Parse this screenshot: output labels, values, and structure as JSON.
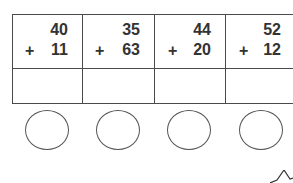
{
  "worksheet": {
    "problems": [
      {
        "top": "40",
        "operator": "+",
        "bottom": "11",
        "answer": ""
      },
      {
        "top": "35",
        "operator": "+",
        "bottom": "63",
        "answer": ""
      },
      {
        "top": "44",
        "operator": "+",
        "bottom": "20",
        "answer": ""
      },
      {
        "top": "52",
        "operator": "+",
        "bottom": "12",
        "answer": ""
      }
    ],
    "circles": 4,
    "corner_shape": "star-icon"
  }
}
